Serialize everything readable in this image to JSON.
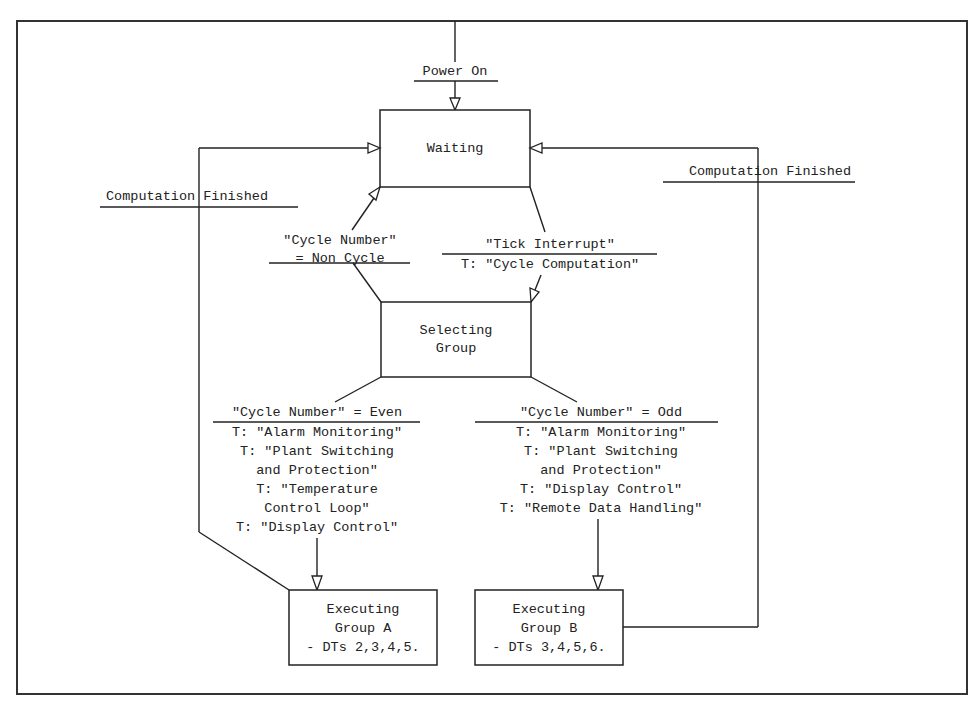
{
  "diagram": {
    "type": "state-transition",
    "states": {
      "waiting": {
        "label": "Waiting"
      },
      "selecting": {
        "lines": [
          "Selecting",
          "Group"
        ]
      },
      "group_a": {
        "lines": [
          "Executing",
          "Group A",
          "- DTs 2,3,4,5."
        ]
      },
      "group_b": {
        "lines": [
          "Executing",
          "Group B",
          "- DTs 3,4,5,6."
        ]
      }
    },
    "transitions": {
      "power_on": {
        "event": "Power On"
      },
      "finished_left": {
        "event": "Computation Finished"
      },
      "finished_right": {
        "event": "Computation Finished"
      },
      "non_cycle": {
        "event_lines": [
          "\"Cycle Number\"",
          "= Non Cycle"
        ]
      },
      "tick": {
        "event": "\"Tick Interrupt\"",
        "action": "T: \"Cycle Computation\""
      },
      "even": {
        "event": "\"Cycle Number\" = Even",
        "actions": [
          "T: \"Alarm Monitoring\"",
          "T: \"Plant Switching",
          "and Protection\"",
          "T: \"Temperature",
          "Control Loop\"",
          "T: \"Display Control\""
        ]
      },
      "odd": {
        "event": "\"Cycle Number\" = Odd",
        "actions": [
          "T: \"Alarm Monitoring\"",
          "T: \"Plant Switching",
          "and Protection\"",
          "T: \"Display Control\"",
          "T: \"Remote Data Handling\""
        ]
      }
    }
  }
}
